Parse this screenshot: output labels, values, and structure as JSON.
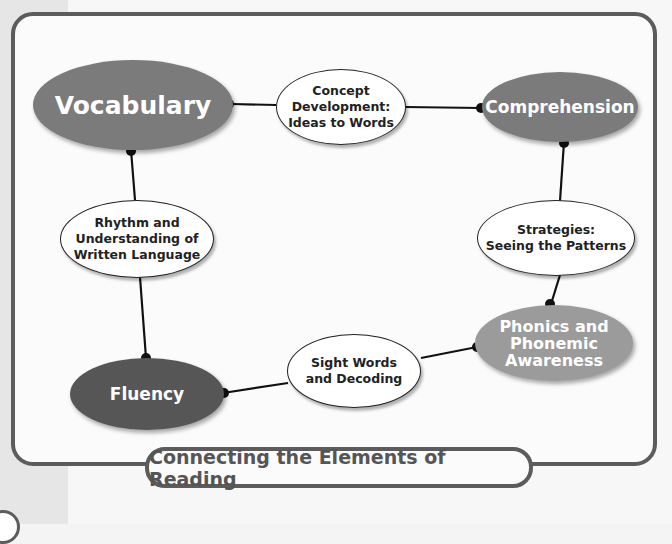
{
  "title": "Connecting the Elements of Reading",
  "colors": {
    "frame": "#5c5c5c",
    "vocabulary": "#7b7b7b",
    "comprehension": "#7b7b7b",
    "phonics": "#9b9b9b",
    "fluency": "#565656",
    "connector": "#111111"
  },
  "nodes": {
    "vocabulary": {
      "label": "Vocabulary"
    },
    "comprehension": {
      "label": "Comprehension"
    },
    "phonics": {
      "label_line1": "Phonics and",
      "label_line2": "Phonemic",
      "label_line3": "Awareness"
    },
    "fluency": {
      "label": "Fluency"
    },
    "concept": {
      "label_line1": "Concept",
      "label_line2": "Development:",
      "label_line3": "Ideas to Words"
    },
    "strategies": {
      "label_line1": "Strategies:",
      "label_line2": "Seeing the Patterns"
    },
    "sight_words": {
      "label_line1": "Sight Words",
      "label_line2": "and Decoding"
    },
    "rhythm": {
      "label_line1": "Rhythm and",
      "label_line2": "Understanding of",
      "label_line3": "Written Language"
    }
  },
  "edges": [
    {
      "from": "vocabulary",
      "to": "concept"
    },
    {
      "from": "concept",
      "to": "comprehension"
    },
    {
      "from": "comprehension",
      "to": "strategies"
    },
    {
      "from": "strategies",
      "to": "phonics"
    },
    {
      "from": "phonics",
      "to": "sight_words"
    },
    {
      "from": "sight_words",
      "to": "fluency"
    },
    {
      "from": "fluency",
      "to": "rhythm"
    },
    {
      "from": "rhythm",
      "to": "vocabulary"
    }
  ]
}
